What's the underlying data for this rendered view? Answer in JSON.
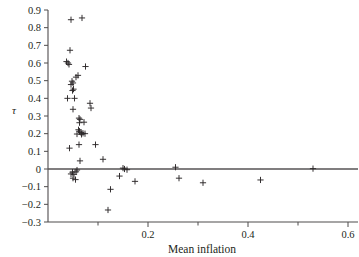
{
  "chart_data": {
    "type": "scatter",
    "title": "",
    "xlabel": "Mean inflation",
    "ylabel": "τ",
    "xlim": [
      0.0,
      0.6
    ],
    "ylim": [
      -0.3,
      0.9
    ],
    "grid": false,
    "legend": null,
    "marker": "plus",
    "reference_lines": [
      {
        "orientation": "horizontal",
        "value": 0,
        "label": "zero line"
      }
    ],
    "x_ticks": [
      0.2,
      0.4,
      0.6
    ],
    "x_tick_labels": [
      "0.2",
      "0.4",
      "0.6"
    ],
    "x_minor_ticks": [
      0.1,
      0.3,
      0.5
    ],
    "y_ticks": [
      -0.3,
      -0.2,
      -0.1,
      0,
      0.1,
      0.2,
      0.3,
      0.4,
      0.5,
      0.6,
      0.7,
      0.8,
      0.9
    ],
    "y_tick_labels": [
      "-0.3",
      "-0.2",
      "-0.1",
      "0",
      "0.1",
      "0.2",
      "0.3",
      "0.4",
      "0.5",
      "0.6",
      "0.7",
      "0.8",
      "0.9"
    ],
    "points": [
      {
        "x": 0.046,
        "y": 0.845
      },
      {
        "x": 0.068,
        "y": 0.855
      },
      {
        "x": 0.044,
        "y": 0.672
      },
      {
        "x": 0.037,
        "y": 0.608
      },
      {
        "x": 0.04,
        "y": 0.6
      },
      {
        "x": 0.042,
        "y": 0.592
      },
      {
        "x": 0.075,
        "y": 0.58
      },
      {
        "x": 0.056,
        "y": 0.52
      },
      {
        "x": 0.048,
        "y": 0.497
      },
      {
        "x": 0.05,
        "y": 0.487
      },
      {
        "x": 0.046,
        "y": 0.478
      },
      {
        "x": 0.06,
        "y": 0.53
      },
      {
        "x": 0.051,
        "y": 0.452
      },
      {
        "x": 0.049,
        "y": 0.444
      },
      {
        "x": 0.039,
        "y": 0.4
      },
      {
        "x": 0.053,
        "y": 0.4
      },
      {
        "x": 0.084,
        "y": 0.372
      },
      {
        "x": 0.086,
        "y": 0.345
      },
      {
        "x": 0.05,
        "y": 0.338
      },
      {
        "x": 0.062,
        "y": 0.288
      },
      {
        "x": 0.064,
        "y": 0.281
      },
      {
        "x": 0.063,
        "y": 0.262
      },
      {
        "x": 0.072,
        "y": 0.265
      },
      {
        "x": 0.061,
        "y": 0.222
      },
      {
        "x": 0.063,
        "y": 0.214
      },
      {
        "x": 0.066,
        "y": 0.206
      },
      {
        "x": 0.07,
        "y": 0.202
      },
      {
        "x": 0.074,
        "y": 0.2
      },
      {
        "x": 0.067,
        "y": 0.196
      },
      {
        "x": 0.058,
        "y": 0.198
      },
      {
        "x": 0.043,
        "y": 0.118
      },
      {
        "x": 0.062,
        "y": 0.138
      },
      {
        "x": 0.095,
        "y": 0.138
      },
      {
        "x": 0.064,
        "y": 0.046
      },
      {
        "x": 0.049,
        "y": -0.018
      },
      {
        "x": 0.046,
        "y": -0.028
      },
      {
        "x": 0.052,
        "y": -0.03
      },
      {
        "x": 0.056,
        "y": -0.016
      },
      {
        "x": 0.058,
        "y": -0.006
      },
      {
        "x": 0.05,
        "y": -0.052
      },
      {
        "x": 0.055,
        "y": -0.06
      },
      {
        "x": 0.11,
        "y": 0.055
      },
      {
        "x": 0.125,
        "y": -0.115
      },
      {
        "x": 0.15,
        "y": 0.005
      },
      {
        "x": 0.153,
        "y": 0.0
      },
      {
        "x": 0.158,
        "y": -0.004
      },
      {
        "x": 0.143,
        "y": -0.04
      },
      {
        "x": 0.174,
        "y": -0.07
      },
      {
        "x": 0.12,
        "y": -0.232
      },
      {
        "x": 0.255,
        "y": 0.01
      },
      {
        "x": 0.262,
        "y": -0.052
      },
      {
        "x": 0.31,
        "y": -0.078
      },
      {
        "x": 0.425,
        "y": -0.062
      },
      {
        "x": 0.53,
        "y": 0.002
      }
    ]
  }
}
